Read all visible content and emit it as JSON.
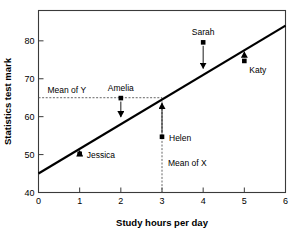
{
  "chart_data": {
    "type": "scatter",
    "title": "",
    "xlabel": "Study hours per day",
    "ylabel": "Statistics test mark",
    "xlim": [
      0,
      6
    ],
    "ylim": [
      40,
      88
    ],
    "xticks": [
      "0",
      "1",
      "2",
      "3",
      "4",
      "5",
      "6"
    ],
    "xtick_values": [
      0,
      1,
      2,
      3,
      4,
      5,
      6
    ],
    "yticks": [
      "40",
      "50",
      "60",
      "70",
      "80"
    ],
    "ytick_values": [
      40,
      50,
      60,
      70,
      80
    ],
    "grid": false,
    "legend": "none",
    "frame": "box",
    "points": [
      {
        "label": "Jessica",
        "x": 1,
        "y": 50.2,
        "fitted": 51.5,
        "residual": -1.3,
        "arrow": "up",
        "label_dx": 7,
        "label_dy": 4
      },
      {
        "label": "Amelia",
        "x": 2,
        "y": 64.9,
        "fitted": 59.5,
        "residual": 5.4,
        "arrow": "down",
        "label_dx": 0,
        "label_dy": -7
      },
      {
        "label": "Helen",
        "x": 3,
        "y": 54.7,
        "fitted": 64.0,
        "residual": -9.3,
        "arrow": "up",
        "label_dx": 7,
        "label_dy": 4
      },
      {
        "label": "Sarah",
        "x": 4,
        "y": 79.6,
        "fitted": 72.3,
        "residual": 7.3,
        "arrow": "down",
        "label_dx": 0,
        "label_dy": -7
      },
      {
        "label": "Katy",
        "x": 5,
        "y": 74.7,
        "fitted": 77.5,
        "residual": -2.8,
        "arrow": "up",
        "label_dx": 5,
        "label_dy": 12
      }
    ],
    "regression_line": {
      "x_start": 0,
      "y_start": 45.0,
      "x_end": 6,
      "y_end": 84.0,
      "slope": 6.5,
      "intercept": 45.0
    },
    "mean_x": {
      "value": 3,
      "label": "Mean of X"
    },
    "mean_y": {
      "value": 65,
      "label": "Mean of Y"
    },
    "series_color": "#000000",
    "line_color": "#000000",
    "mean_line_color": "#555555"
  },
  "labels": {
    "mean_of_y": "Mean of Y",
    "mean_of_x": "Mean of X"
  }
}
